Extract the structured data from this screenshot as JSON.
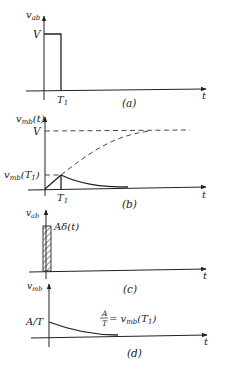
{
  "figure": {
    "panels": [
      {
        "id": "a",
        "caption": "(a)",
        "y_label": "v",
        "y_label_sub": "ab",
        "t_label": "t",
        "level_label": "V",
        "tick_label": "T",
        "tick_sub": "1",
        "description": "Rectangular pulse of height V from 0 to T1"
      },
      {
        "id": "b",
        "caption": "(b)",
        "y_label": "v",
        "y_label_sub": "mb",
        "y_label_arg": "(t)",
        "t_label": "t",
        "level_label": "V",
        "mid_label": "v",
        "mid_label_sub": "mb",
        "mid_label_arg": "(T",
        "mid_label_arg_sub": "1",
        "mid_label_arg_close": ")",
        "tick_label": "T",
        "tick_sub": "1",
        "description": "Exponential charge toward V (dashed) truncated at T1, then exponential decay"
      },
      {
        "id": "c",
        "caption": "(c)",
        "y_label": "v",
        "y_label_sub": "ab",
        "t_label": "t",
        "impulse_label": "Aδ(t)",
        "description": "Impulse approximated by a narrow hatched rectangle"
      },
      {
        "id": "d",
        "caption": "(d)",
        "y_label": "v",
        "y_label_sub": "mb",
        "t_label": "t",
        "level_label": "A/T",
        "eq_num": "A",
        "eq_den": "T",
        "eq_rhs": "= v",
        "eq_rhs_sub": "mb",
        "eq_rhs_arg": "(T",
        "eq_rhs_arg_sub": "1",
        "eq_rhs_arg_close": ")",
        "description": "Impulse response: exponential decay starting at A/T"
      }
    ]
  }
}
